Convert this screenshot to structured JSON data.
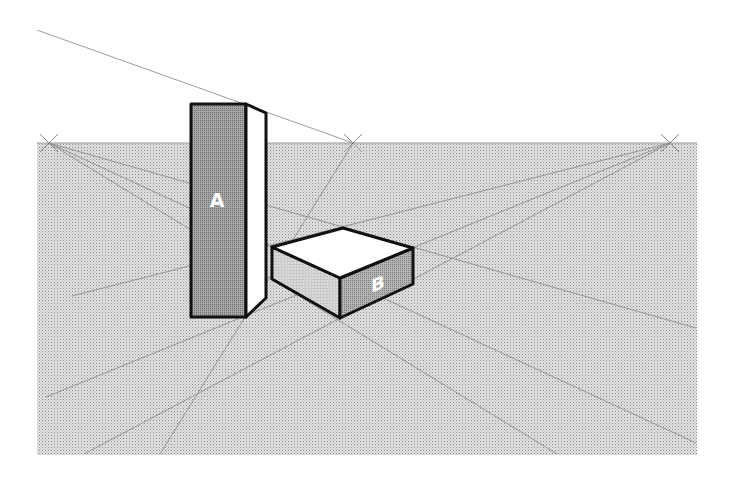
{
  "figure": {
    "type": "two-point perspective drawing",
    "colors": {
      "background": "#ffffff",
      "ground": "#dcdcdc",
      "ground_dot": "#9a9a9a",
      "guide_line": "#8f8f8f",
      "outline": "#111111",
      "face_dark": "#9e9e9e",
      "face_mid": "#b8b8b8",
      "face_light": "#d8d8d8",
      "face_white": "#ffffff",
      "label_text": "#ffffff"
    },
    "ground_plane": {
      "x": 37,
      "y": 143,
      "width": 660,
      "height": 312
    },
    "horizon_y": 143,
    "vanishing_points": [
      {
        "name": "left-vp",
        "x": 49,
        "y": 143
      },
      {
        "name": "middle-vp",
        "x": 353,
        "y": 143
      },
      {
        "name": "right-vp",
        "x": 670,
        "y": 143
      }
    ],
    "objects": [
      {
        "name": "box-a",
        "label": "A",
        "front_face": "191,104 246,104 246,317 191,317",
        "side_face": "246,104 266,113 266,298 246,317",
        "label_pos": {
          "x": 217,
          "y": 207
        }
      },
      {
        "name": "box-b",
        "label": "B",
        "top_face": "272,247 343,228 413,248 340,278",
        "left_face": "272,247 340,278 340,318 272,279",
        "right_face": "340,278 413,248 413,284 340,318",
        "label_pos": {
          "x": 378,
          "y": 290
        }
      }
    ]
  }
}
